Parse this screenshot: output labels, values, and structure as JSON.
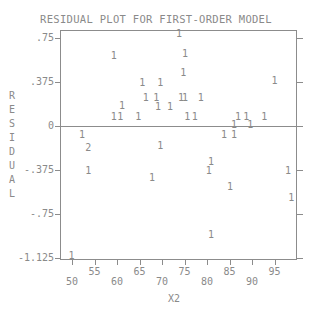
{
  "chart_data": {
    "type": "scatter",
    "title": "RESIDUAL PLOT FOR FIRST-ORDER MODEL",
    "xlabel": "X2",
    "ylabel": "RESIDUAL",
    "xlim": [
      48,
      100
    ],
    "ylim": [
      -1.15,
      0.8
    ],
    "x_ticks": [
      50,
      55,
      60,
      65,
      70,
      75,
      80,
      85,
      90,
      95
    ],
    "y_ticks": [
      0.75,
      0.375,
      0,
      -0.375,
      -0.75,
      -1.125
    ],
    "y_tick_labels": [
      ".75",
      ".375",
      "0",
      "-.375",
      "-.75",
      "-1.125"
    ],
    "reference_line": 0,
    "marker": "count glyph (1 = one observation, 2 = two observations)",
    "points": [
      {
        "x": 73.8,
        "y": 0.78,
        "label": "1"
      },
      {
        "x": 59.3,
        "y": 0.6,
        "label": "1"
      },
      {
        "x": 75.1,
        "y": 0.61,
        "label": "1"
      },
      {
        "x": 74.7,
        "y": 0.45,
        "label": "1"
      },
      {
        "x": 65.6,
        "y": 0.37,
        "label": "1"
      },
      {
        "x": 69.6,
        "y": 0.37,
        "label": "1"
      },
      {
        "x": 95.0,
        "y": 0.38,
        "label": "1"
      },
      {
        "x": 66.4,
        "y": 0.24,
        "label": "1"
      },
      {
        "x": 68.7,
        "y": 0.24,
        "label": "1"
      },
      {
        "x": 74.2,
        "y": 0.24,
        "label": "1"
      },
      {
        "x": 75.1,
        "y": 0.24,
        "label": "1"
      },
      {
        "x": 78.6,
        "y": 0.24,
        "label": "1"
      },
      {
        "x": 61.1,
        "y": 0.17,
        "label": "1"
      },
      {
        "x": 69.1,
        "y": 0.16,
        "label": "1"
      },
      {
        "x": 71.8,
        "y": 0.16,
        "label": "1"
      },
      {
        "x": 59.3,
        "y": 0.08,
        "label": "1"
      },
      {
        "x": 60.7,
        "y": 0.08,
        "label": "1"
      },
      {
        "x": 64.7,
        "y": 0.08,
        "label": "1"
      },
      {
        "x": 75.6,
        "y": 0.08,
        "label": "1"
      },
      {
        "x": 77.3,
        "y": 0.08,
        "label": "1"
      },
      {
        "x": 86.9,
        "y": 0.08,
        "label": "1"
      },
      {
        "x": 88.7,
        "y": 0.08,
        "label": "1"
      },
      {
        "x": 92.7,
        "y": 0.08,
        "label": "1"
      },
      {
        "x": 86.0,
        "y": 0.01,
        "label": "1"
      },
      {
        "x": 89.6,
        "y": 0.01,
        "label": "1"
      },
      {
        "x": 52.2,
        "y": -0.08,
        "label": "1"
      },
      {
        "x": 83.8,
        "y": -0.08,
        "label": "1"
      },
      {
        "x": 86.0,
        "y": -0.08,
        "label": "1"
      },
      {
        "x": 53.6,
        "y": -0.19,
        "label": "2"
      },
      {
        "x": 69.6,
        "y": -0.17,
        "label": "1"
      },
      {
        "x": 80.9,
        "y": -0.31,
        "label": "1"
      },
      {
        "x": 80.4,
        "y": -0.38,
        "label": "1"
      },
      {
        "x": 53.6,
        "y": -0.38,
        "label": "1"
      },
      {
        "x": 98.0,
        "y": -0.38,
        "label": "1"
      },
      {
        "x": 67.8,
        "y": -0.44,
        "label": "1"
      },
      {
        "x": 85.1,
        "y": -0.52,
        "label": "1"
      },
      {
        "x": 98.7,
        "y": -0.61,
        "label": "1"
      },
      {
        "x": 80.9,
        "y": -0.93,
        "label": "1"
      },
      {
        "x": 49.9,
        "y": -1.11,
        "label": "1"
      }
    ]
  }
}
